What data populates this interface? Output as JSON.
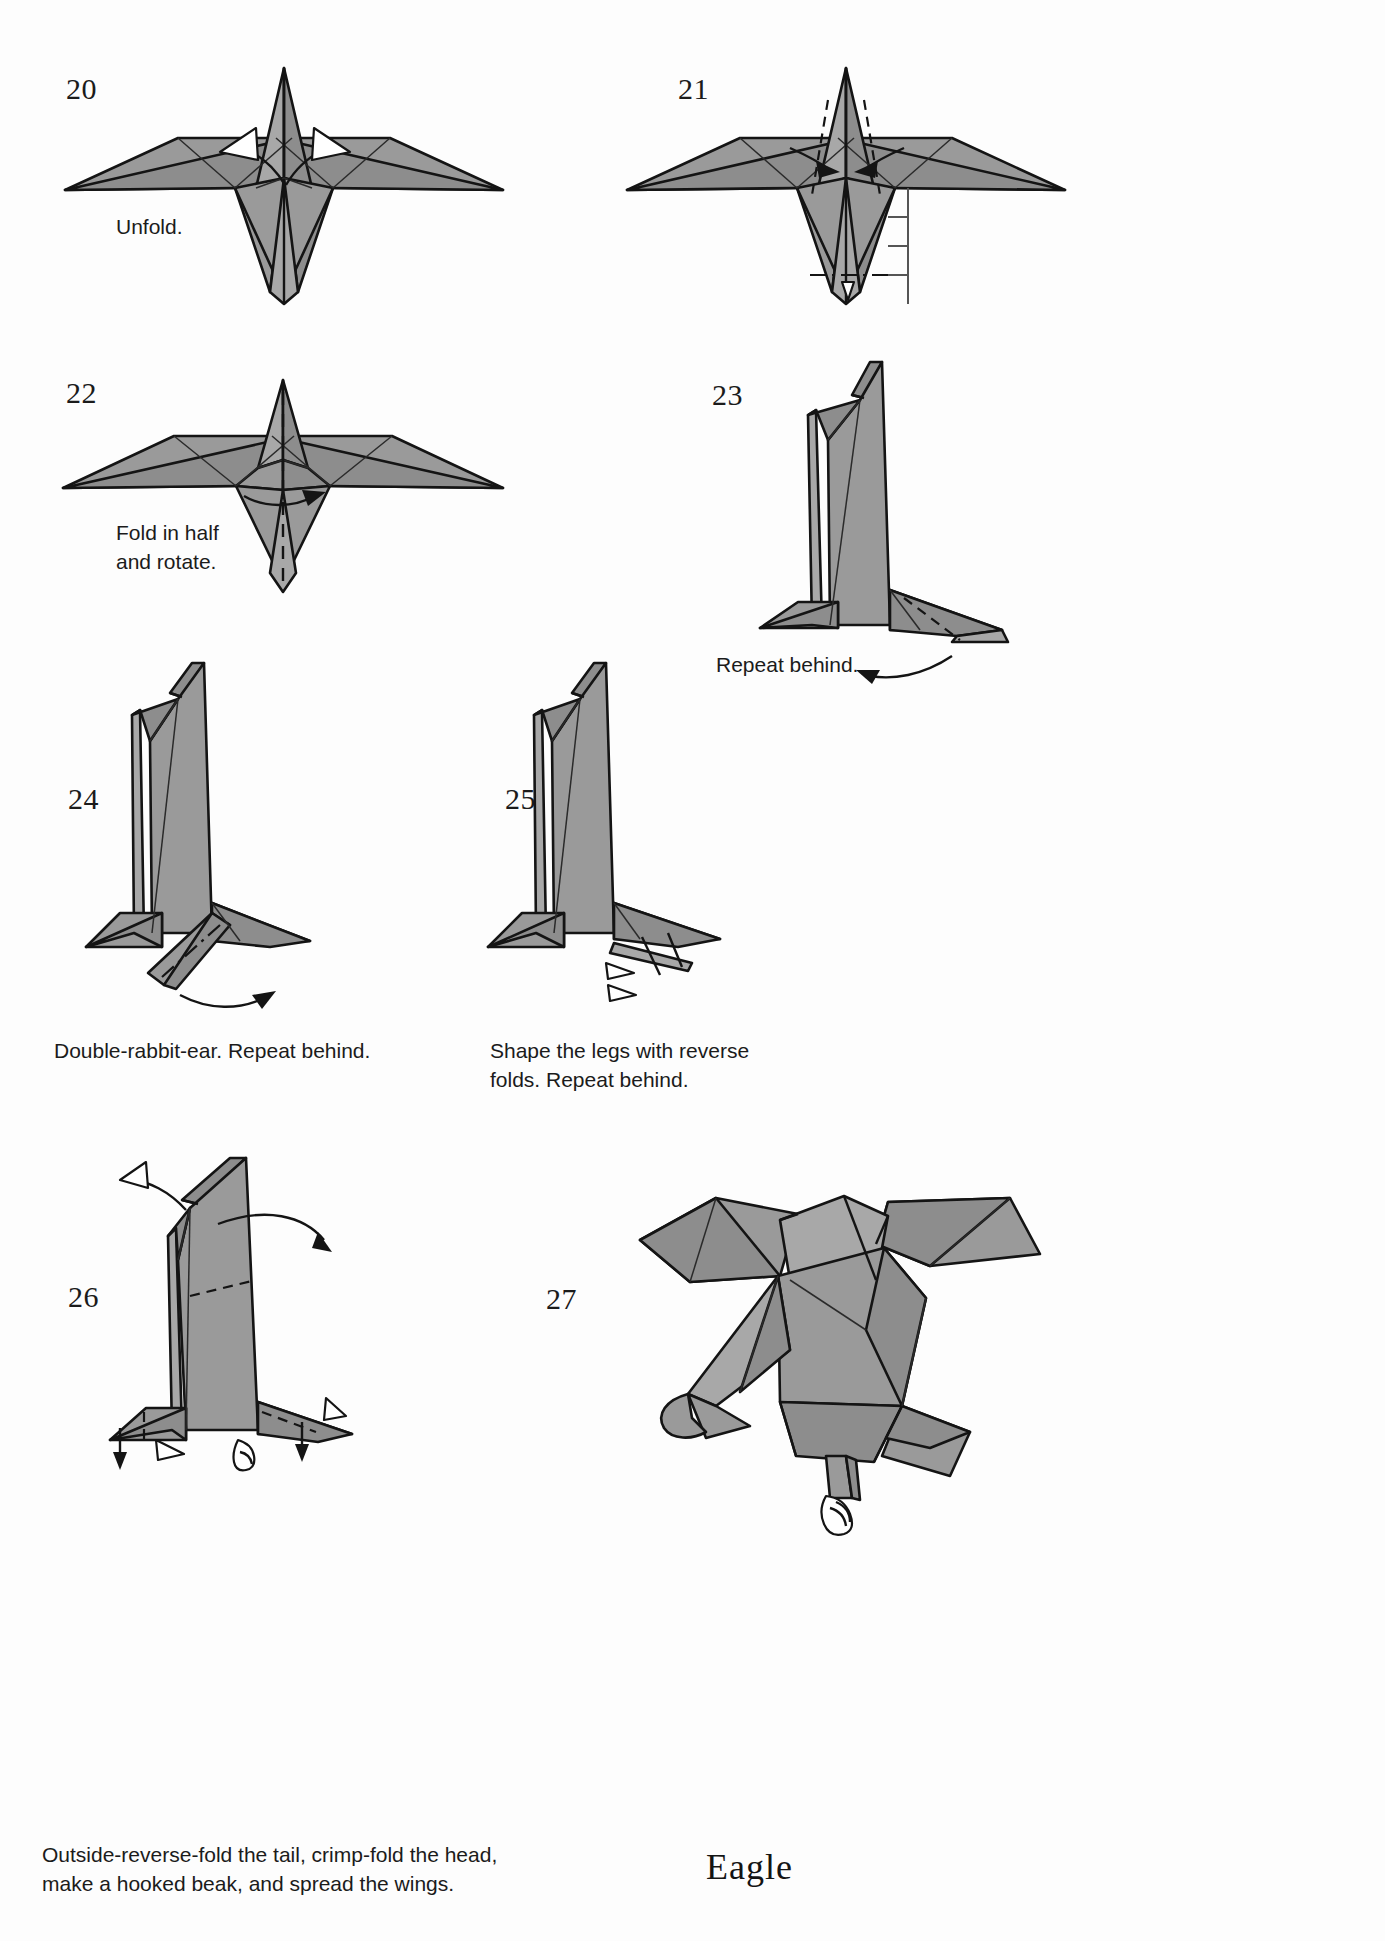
{
  "page": {
    "width": 1385,
    "height": 1941,
    "background": "#ffffff",
    "paper_fill": "#9a9a9a",
    "ink": "#141414",
    "model_name": "Eagle"
  },
  "steps": [
    {
      "number": "20",
      "caption": "Unfold.",
      "view": "front, wings spread, body point up",
      "markers": [
        "two hollow unfold arrows at the body sides"
      ]
    },
    {
      "number": "21",
      "caption": "",
      "view": "front, wings spread",
      "markers": [
        "two solid arrows pointing inward toward centre",
        "two valley fold lines on body",
        "dash-dot horizontal reference line across tail tip",
        "ruler with tick marks at right of tail"
      ]
    },
    {
      "number": "22",
      "caption": "Fold in half\nand rotate.",
      "view": "front, wings spread",
      "markers": [
        "vertical valley fold down the centre",
        "curved rotate arrow at body base"
      ]
    },
    {
      "number": "23",
      "caption": "Repeat behind.",
      "view": "side, standing upright",
      "markers": [
        "valley fold on the leg",
        "curved repeat-behind arrow"
      ]
    },
    {
      "number": "24",
      "caption": "Double-rabbit-ear. Repeat behind.",
      "view": "side, standing",
      "markers": [
        "dash-dot crease on the foot",
        "curved repeat-behind arrow"
      ]
    },
    {
      "number": "25",
      "caption": "Shape the legs with reverse\nfolds. Repeat behind.",
      "view": "side, standing",
      "markers": [
        "two hollow reverse-fold arrows at the foot",
        "tick hash marks"
      ]
    },
    {
      "number": "26",
      "caption": "Outside-reverse-fold the tail, crimp-fold the head,\nmake a hooked beak, and spread the wings.",
      "view": "side, standing, tall body",
      "markers": [
        "hollow arrow at upper left (head)",
        "curved arrow at upper right (wing spread)",
        "valley fold across the body",
        "down arrows and hollow arrows at the feet"
      ]
    },
    {
      "number": "27",
      "caption": "",
      "view": "finished eagle, three-quarter side view",
      "markers": []
    }
  ],
  "labels": {
    "step20": "20",
    "step21": "21",
    "step22": "22",
    "step23": "23",
    "step24": "24",
    "step25": "25",
    "step26": "26",
    "step27": "27",
    "caption20": "Unfold.",
    "caption22": "Fold in half\nand rotate.",
    "caption23": "Repeat behind.",
    "caption24": "Double-rabbit-ear. Repeat behind.",
    "caption25": "Shape the legs with reverse\nfolds. Repeat behind.",
    "caption26": "Outside-reverse-fold the tail, crimp-fold the head,\nmake a hooked beak, and spread the wings.",
    "model_name": "Eagle"
  }
}
